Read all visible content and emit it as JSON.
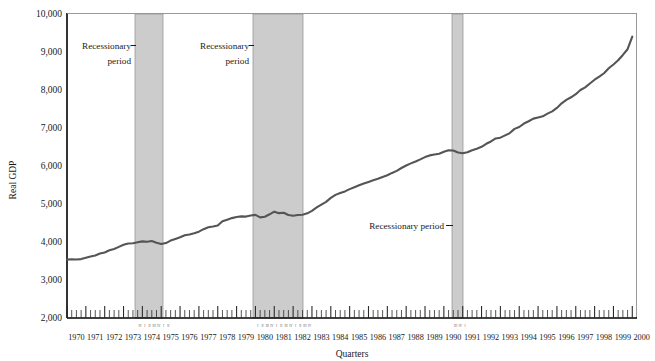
{
  "chart_data": {
    "type": "line",
    "title": "",
    "xlabel": "Quarters",
    "ylabel": "Real GDP",
    "ylim": [
      2000,
      10000
    ],
    "ytick_labels": [
      "2,000",
      "3,000",
      "4,000",
      "5,000",
      "6,000",
      "7,000",
      "8,000",
      "9,000",
      "10,000"
    ],
    "ytick_values": [
      2000,
      3000,
      4000,
      5000,
      6000,
      7000,
      8000,
      9000,
      10000
    ],
    "grid": false,
    "legend": "none",
    "x_tick_unit": "quarter",
    "quarter_tick_labels": [
      "I",
      "II",
      "III",
      "IV"
    ],
    "categories": [
      "1970",
      "1971",
      "1972",
      "1973",
      "1974",
      "1975",
      "1976",
      "1977",
      "1978",
      "1979",
      "1980",
      "1981",
      "1982",
      "1983",
      "1984",
      "1985",
      "1986",
      "1987",
      "1988",
      "1989",
      "1990",
      "1991",
      "1992",
      "1993",
      "1994",
      "1995",
      "1996",
      "1997",
      "1998",
      "1999",
      "2000"
    ],
    "series": [
      {
        "name": "Real GDP",
        "color": "#555555",
        "x": [
          1970.0,
          1970.25,
          1970.5,
          1970.75,
          1971.0,
          1971.25,
          1971.5,
          1971.75,
          1972.0,
          1972.25,
          1972.5,
          1972.75,
          1973.0,
          1973.25,
          1973.5,
          1973.75,
          1974.0,
          1974.25,
          1974.5,
          1974.75,
          1975.0,
          1975.25,
          1975.5,
          1975.75,
          1976.0,
          1976.25,
          1976.5,
          1976.75,
          1977.0,
          1977.25,
          1977.5,
          1977.75,
          1978.0,
          1978.25,
          1978.5,
          1978.75,
          1979.0,
          1979.25,
          1979.5,
          1979.75,
          1980.0,
          1980.25,
          1980.5,
          1980.75,
          1981.0,
          1981.25,
          1981.5,
          1981.75,
          1982.0,
          1982.25,
          1982.5,
          1982.75,
          1983.0,
          1983.25,
          1983.5,
          1983.75,
          1984.0,
          1984.25,
          1984.5,
          1984.75,
          1985.0,
          1985.25,
          1985.5,
          1985.75,
          1986.0,
          1986.25,
          1986.5,
          1986.75,
          1987.0,
          1987.25,
          1987.5,
          1987.75,
          1988.0,
          1988.25,
          1988.5,
          1988.75,
          1989.0,
          1989.25,
          1989.5,
          1989.75,
          1990.0,
          1990.25,
          1990.5,
          1990.75,
          1991.0,
          1991.25,
          1991.5,
          1991.75,
          1992.0,
          1992.25,
          1992.5,
          1992.75,
          1993.0,
          1993.25,
          1993.5,
          1993.75,
          1994.0,
          1994.25,
          1994.5,
          1994.75,
          1995.0,
          1995.25,
          1995.5,
          1995.75,
          1996.0,
          1996.25,
          1996.5,
          1996.75,
          1997.0,
          1997.25,
          1997.5,
          1997.75,
          1998.0,
          1998.25,
          1998.5,
          1998.75,
          1999.0,
          1999.25,
          1999.5,
          1999.75,
          2000.0
        ],
        "values": [
          3530,
          3540,
          3535,
          3545,
          3580,
          3615,
          3640,
          3690,
          3720,
          3775,
          3810,
          3865,
          3920,
          3955,
          3960,
          3985,
          4010,
          4000,
          4020,
          3975,
          3940,
          3965,
          4030,
          4075,
          4120,
          4170,
          4190,
          4225,
          4265,
          4330,
          4380,
          4400,
          4425,
          4540,
          4580,
          4620,
          4650,
          4665,
          4660,
          4690,
          4705,
          4640,
          4655,
          4720,
          4790,
          4750,
          4760,
          4700,
          4680,
          4700,
          4710,
          4745,
          4810,
          4900,
          4975,
          5045,
          5150,
          5230,
          5280,
          5320,
          5380,
          5430,
          5480,
          5530,
          5570,
          5610,
          5650,
          5700,
          5745,
          5805,
          5860,
          5935,
          6000,
          6055,
          6105,
          6160,
          6220,
          6265,
          6290,
          6310,
          6360,
          6400,
          6395,
          6340,
          6320,
          6350,
          6400,
          6440,
          6490,
          6570,
          6630,
          6710,
          6730,
          6790,
          6850,
          6960,
          7010,
          7100,
          7160,
          7230,
          7260,
          7290,
          7360,
          7420,
          7510,
          7630,
          7720,
          7790,
          7870,
          7980,
          8050,
          8150,
          8250,
          8330,
          8420,
          8550,
          8650,
          8760,
          8900,
          9050,
          9380
        ]
      }
    ],
    "shaded_regions": [
      {
        "name": "recession-1973-1975",
        "label": "Recessionary period",
        "start": 1973.75,
        "end": 1975.25,
        "color": "#cccccc"
      },
      {
        "name": "recession-1980-1982",
        "label": "Recessionary period",
        "start": 1980.0,
        "end": 1982.75,
        "color": "#cccccc"
      },
      {
        "name": "recession-1990-1991",
        "label": "Recessionary period",
        "start": 1990.5,
        "end": 1991.0,
        "color": "#cccccc"
      }
    ],
    "annotations": [
      {
        "name": "recession-annotation-1",
        "line1": "Recessionary",
        "line2": "period"
      },
      {
        "name": "recession-annotation-2",
        "line1": "Recessionary",
        "line2": "period"
      },
      {
        "name": "recession-annotation-3",
        "line1": "Recessionary period",
        "line2": ""
      }
    ]
  },
  "axis": {
    "y_title": "Real GDP",
    "x_title": "Quarters"
  },
  "colors": {
    "line": "#555555",
    "shade": "#cccccc",
    "axis": "#000000",
    "text": "#1a1a1a"
  }
}
